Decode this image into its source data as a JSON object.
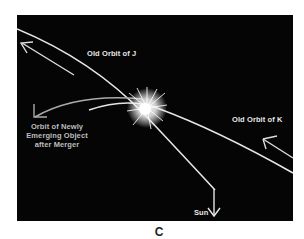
{
  "figure": {
    "caption": "C",
    "background_color": "#050505",
    "line_color": "#e6e6e6",
    "labels": {
      "old_orbit_j": "Old Orbit of J",
      "old_orbit_k": "Old Orbit of K",
      "new_object_orbit": "Orbit of Newly Emerging Object after Merger",
      "sun": "Sun"
    },
    "elements": [
      {
        "type": "orbit-line",
        "name": "old-orbit-j",
        "direction": "toward upper-left"
      },
      {
        "type": "orbit-line",
        "name": "old-orbit-k",
        "direction": "toward upper-left from right edge"
      },
      {
        "type": "orbit-line",
        "name": "new-object-orbit",
        "direction": "toward left"
      },
      {
        "type": "collision",
        "name": "merger-flash"
      },
      {
        "type": "arrow",
        "name": "sun-direction",
        "direction": "down"
      }
    ]
  }
}
